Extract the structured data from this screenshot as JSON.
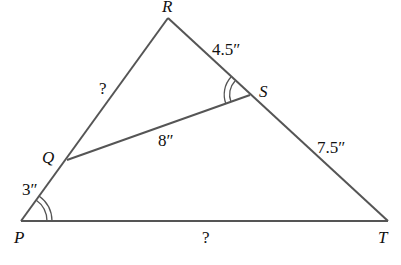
{
  "diagram": {
    "vertices": {
      "R": {
        "label": "R",
        "x": 168,
        "y": 18
      },
      "P": {
        "label": "P",
        "x": 21,
        "y": 221
      },
      "T": {
        "label": "T",
        "x": 388,
        "y": 221
      },
      "Q": {
        "label": "Q",
        "x": 67,
        "y": 160
      },
      "S": {
        "label": "S",
        "x": 250,
        "y": 95
      }
    },
    "measures": {
      "RS": "4.5″",
      "ST": "7.5″",
      "QS": "8″",
      "PQ": "3″",
      "RQ": "?",
      "PT": "?"
    },
    "line_color": "#555555"
  }
}
